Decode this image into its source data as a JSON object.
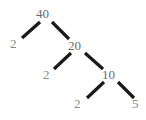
{
  "diagram": {
    "type": "binary-tree",
    "title": "",
    "background_color": "#ffffff",
    "edge_color": "#1a1a1a",
    "node_text_color": "#6e6e6e",
    "leaf_text_color": "#8a8a8a",
    "nodes": [
      {
        "id": "root",
        "label": "40",
        "role": "internal",
        "x": 44,
        "y": 14,
        "left": 15,
        "top": 7
      },
      {
        "id": "n-l1",
        "label": "2",
        "role": "leaf",
        "x": 14,
        "y": 44,
        "left": 9,
        "top": 37
      },
      {
        "id": "n-20",
        "label": "20",
        "role": "internal",
        "x": 76,
        "y": 46,
        "left": 67,
        "top": 39
      },
      {
        "id": "n-l2",
        "label": "2",
        "role": "leaf",
        "x": 47,
        "y": 75,
        "left": 42,
        "top": 68
      },
      {
        "id": "n-10",
        "label": "10",
        "role": "internal",
        "x": 110,
        "y": 75,
        "left": 101,
        "top": 68
      },
      {
        "id": "n-l3",
        "label": "2",
        "role": "leaf",
        "x": 78,
        "y": 104,
        "left": 73,
        "top": 97
      },
      {
        "id": "n-l4",
        "label": "5",
        "role": "leaf",
        "x": 136,
        "y": 104,
        "left": 131,
        "top": 97
      }
    ],
    "edges": [
      {
        "id": "edge-root-left",
        "from": "root",
        "to": "n-l1",
        "x1": 40,
        "y1": 22,
        "x2": 22,
        "y2": 38
      },
      {
        "id": "edge-root-right",
        "from": "root",
        "to": "n-20",
        "x1": 52,
        "y1": 22,
        "x2": 69,
        "y2": 39
      },
      {
        "id": "edge-20-left",
        "from": "n-20",
        "to": "n-l2",
        "x1": 71,
        "y1": 53,
        "x2": 54,
        "y2": 69
      },
      {
        "id": "edge-20-right",
        "from": "n-20",
        "to": "n-10",
        "x1": 85,
        "y1": 53,
        "x2": 103,
        "y2": 69
      },
      {
        "id": "edge-10-left",
        "from": "n-10",
        "to": "n-l3",
        "x1": 104,
        "y1": 82,
        "x2": 87,
        "y2": 98
      },
      {
        "id": "edge-10-right",
        "from": "n-10",
        "to": "n-l4",
        "x1": 118,
        "y1": 82,
        "x2": 134,
        "y2": 98
      }
    ]
  }
}
